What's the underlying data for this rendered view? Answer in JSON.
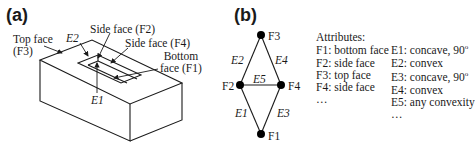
{
  "panel_a": {
    "label": "(a)",
    "callouts": {
      "top_face": [
        "Top face",
        "(F3)"
      ],
      "e2": "E2",
      "side_f2": "Side face  (F2)",
      "side_f4": "Side face  (F4)",
      "bottom": [
        "Bottom",
        "face (F1)"
      ],
      "e1": "E1"
    }
  },
  "panel_b": {
    "label": "(b)",
    "nodes": [
      {
        "id": "F3",
        "label": "F3",
        "x": 261,
        "y": 35
      },
      {
        "id": "F2",
        "label": "F2",
        "x": 240,
        "y": 85
      },
      {
        "id": "F4",
        "label": "F4",
        "x": 281,
        "y": 85
      },
      {
        "id": "F1",
        "label": "F1",
        "x": 261,
        "y": 134
      }
    ],
    "edges": [
      {
        "id": "E2",
        "label": "E2",
        "from": "F2",
        "to": "F3"
      },
      {
        "id": "E4",
        "label": "E4",
        "from": "F4",
        "to": "F3"
      },
      {
        "id": "E5",
        "label": "E5",
        "from": "F2",
        "to": "F4"
      },
      {
        "id": "E1",
        "label": "E1",
        "from": "F2",
        "to": "F1"
      },
      {
        "id": "E3",
        "label": "E3",
        "from": "F4",
        "to": "F1"
      }
    ],
    "attributes": {
      "title": "Attributes:",
      "faces": [
        "F1: bottom face",
        "F2: side face",
        "F3: top face",
        "F4: side face",
        "…"
      ],
      "edges": [
        {
          "text": "E1: concave, 90",
          "sup": "o"
        },
        {
          "text": "E2: convex",
          "sup": ""
        },
        {
          "text": "E3: concave, 90",
          "sup": "o"
        },
        {
          "text": "E4: convex",
          "sup": ""
        },
        {
          "text": "E5: any convexity",
          "sup": ""
        },
        {
          "text": "…",
          "sup": ""
        }
      ]
    }
  }
}
